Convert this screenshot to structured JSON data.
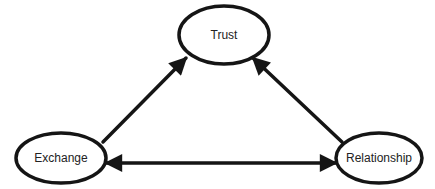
{
  "diagram": {
    "type": "triangle-relationship",
    "colors": {
      "stroke": "#151515",
      "text": "#222222",
      "background": "#ffffff"
    },
    "nodes": [
      {
        "id": "trust",
        "label": "Trust",
        "cx": 224,
        "cy": 35,
        "rx": 45,
        "ry": 29
      },
      {
        "id": "exchange",
        "label": "Exchange",
        "cx": 61,
        "cy": 158,
        "rx": 45,
        "ry": 25
      },
      {
        "id": "relationship",
        "label": "Relationship",
        "cx": 379,
        "cy": 158,
        "rx": 43,
        "ry": 25
      }
    ],
    "edges": [
      {
        "from": "exchange",
        "to": "trust",
        "arrow": "end"
      },
      {
        "from": "relationship",
        "to": "trust",
        "arrow": "end"
      },
      {
        "from": "exchange",
        "to": "relationship",
        "arrow": "both"
      }
    ]
  }
}
